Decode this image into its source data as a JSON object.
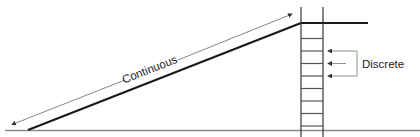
{
  "diagram": {
    "labels": {
      "continuous": "Continuous",
      "discrete": "Discrete"
    },
    "colors": {
      "line": "#1a1a1a",
      "thin": "#555555",
      "ground": "#888888",
      "rung": "#666666"
    },
    "elements": {
      "ramp": "Continuous slope rising from ground to platform",
      "ladder": "Ladder with discrete rungs",
      "ladder_rung_count": 8,
      "discrete_arrow_count": 3
    }
  }
}
